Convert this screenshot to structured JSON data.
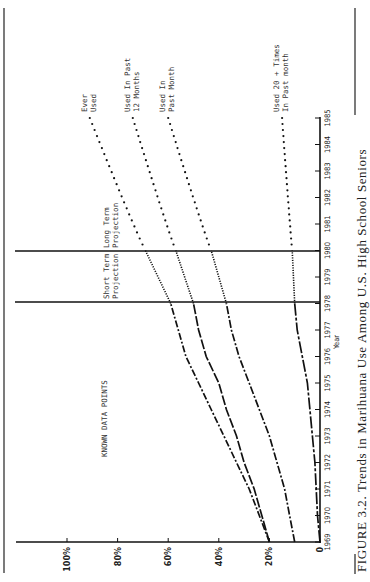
{
  "chart_data": {
    "type": "line",
    "title": "FIGURE 3.2. Trends in Marihuana Use Among U.S. High School Seniors",
    "xlabel": "Year",
    "ylabel": "",
    "orientation_note": "figure printed rotated 90° counter-clockwise on page",
    "x": [
      1969,
      1970,
      1971,
      1972,
      1973,
      1974,
      1975,
      1976,
      1977,
      1978,
      1979,
      1980,
      1981,
      1982,
      1983,
      1984,
      1985
    ],
    "x_ticks": [
      "1969",
      "1970",
      "1971",
      "1972",
      "1973",
      "1974",
      "1975",
      "1976",
      "1977",
      "1978",
      "1979",
      "1980",
      "1981",
      "1982",
      "1983",
      "1984",
      "1985"
    ],
    "y_ticks": [
      "0",
      "20%",
      "40%",
      "60%",
      "80%",
      "100%"
    ],
    "ylim": [
      0,
      100
    ],
    "xlim": [
      1969,
      1985
    ],
    "grid": false,
    "regions": [
      {
        "label": "KNOWN DATA POINTS",
        "from": 1969,
        "to": 1978
      },
      {
        "label": "Short Term Projection",
        "from": 1978,
        "to": 1980
      },
      {
        "label": "Long Term Projection",
        "from": 1980,
        "to": 1985
      }
    ],
    "projection_lines": [
      1978,
      1980
    ],
    "series": [
      {
        "name": "Ever Used",
        "label_lines": [
          "Ever",
          "Used"
        ],
        "known": {
          "x": [
            1969,
            1970,
            1971,
            1972,
            1973,
            1974,
            1975,
            1976,
            1977,
            1978
          ],
          "values": [
            20,
            24,
            28,
            33,
            38,
            43,
            48,
            53,
            56,
            59
          ]
        },
        "short_term": {
          "x": [
            1978,
            1980
          ],
          "values": [
            59,
            69
          ]
        },
        "long_term": {
          "x": [
            1980,
            1985
          ],
          "values": [
            69,
            91
          ]
        }
      },
      {
        "name": "Used In Past 12 Months",
        "label_lines": [
          "Used In Past",
          "12 Months"
        ],
        "known": {
          "x": [
            1969,
            1970,
            1971,
            1972,
            1973,
            1974,
            1975,
            1976,
            1977,
            1978
          ],
          "values": [
            20,
            23,
            26,
            30,
            33,
            37,
            40,
            45,
            48,
            50
          ]
        },
        "short_term": {
          "x": [
            1978,
            1980
          ],
          "values": [
            50,
            57
          ]
        },
        "long_term": {
          "x": [
            1980,
            1985
          ],
          "values": [
            57,
            74
          ]
        }
      },
      {
        "name": "Used In Past Month",
        "label_lines": [
          "Used In",
          "Past Month"
        ],
        "known": {
          "x": [
            1969,
            1970,
            1971,
            1972,
            1973,
            1974,
            1975,
            1976,
            1977,
            1978
          ],
          "values": [
            10,
            12,
            14,
            17,
            20,
            24,
            28,
            32,
            35,
            37
          ]
        },
        "short_term": {
          "x": [
            1978,
            1980
          ],
          "values": [
            37,
            43
          ]
        },
        "long_term": {
          "x": [
            1980,
            1985
          ],
          "values": [
            43,
            60
          ]
        }
      },
      {
        "name": "Used 20 + Times In Past month",
        "label_lines": [
          "Used 20 + Times",
          "In Past month"
        ],
        "known": {
          "x": [
            1969,
            1970,
            1971,
            1972,
            1973,
            1974,
            1975,
            1976,
            1977,
            1978
          ],
          "values": [
            0,
            1,
            1.5,
            2,
            3,
            4,
            5,
            7,
            9,
            10
          ]
        },
        "short_term": {
          "x": [
            1978,
            1980
          ],
          "values": [
            10,
            11
          ]
        },
        "long_term": {
          "x": [
            1980,
            1985
          ],
          "values": [
            11,
            15
          ]
        }
      }
    ],
    "legend": "inline labels at end of each series"
  },
  "figure": {
    "caption": "FIGURE 3.2. Trends in Marihuana Use Among U.S. High School Seniors",
    "axis_title_x": "Year",
    "known_region_label": "KNOWN DATA POINTS",
    "short_term_label": [
      "Short Term",
      "Projection"
    ],
    "long_term_label": [
      "Long Term",
      "Projection"
    ]
  }
}
